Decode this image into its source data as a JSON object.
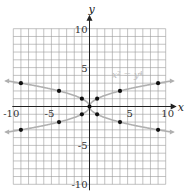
{
  "chart_data": {
    "type": "scatter",
    "title": "",
    "xlabel": "x",
    "ylabel": "y",
    "xlim": [
      -10,
      10
    ],
    "ylim": [
      -10,
      10
    ],
    "grid": true,
    "x_ticks": [
      -10,
      -5,
      5,
      10
    ],
    "y_ticks": [
      10,
      5,
      -5,
      -10
    ],
    "x_tick_labels": [
      "-10",
      "-5",
      "5",
      "10"
    ],
    "y_tick_labels": [
      "10",
      "5",
      "-5",
      "-10"
    ],
    "curve_label": "x² = y⁴",
    "series": [
      {
        "name": "x² = y⁴ (points)",
        "points": [
          [
            -9,
            3
          ],
          [
            -4,
            2
          ],
          [
            -1,
            1
          ],
          [
            0,
            0
          ],
          [
            1,
            1
          ],
          [
            4,
            2
          ],
          [
            9,
            3
          ],
          [
            -9,
            -3
          ],
          [
            -4,
            -2
          ],
          [
            -1,
            -1
          ],
          [
            1,
            -1
          ],
          [
            4,
            -2
          ],
          [
            9,
            -3
          ]
        ]
      }
    ],
    "curves": [
      {
        "name": "y = sqrt(|x|)",
        "description": "upper branch"
      },
      {
        "name": "y = -sqrt(|x|)",
        "description": "lower branch"
      }
    ]
  },
  "labels": {
    "x_axis": "x",
    "y_axis": "y",
    "equation": "x² = y⁴"
  },
  "colors": {
    "grid": "#9a9a9a",
    "axis": "#222222",
    "curve": "#b0b0b0",
    "point": "#111111"
  }
}
